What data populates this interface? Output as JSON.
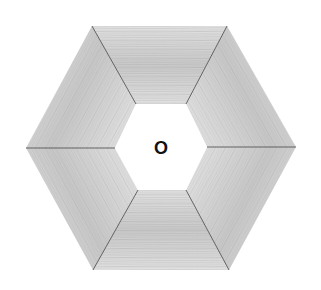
{
  "figure": {
    "center_label": "O",
    "colors": {
      "wood_base": "#c9c9c9",
      "wood_light": "#e2e2e2",
      "wood_dark": "#9a9a9a",
      "seam": "#555555",
      "hole": "#ffffff"
    },
    "outer_hexagon": [
      [
        92,
        26
      ],
      [
        227,
        26
      ],
      [
        296,
        147
      ],
      [
        229,
        270
      ],
      [
        93,
        270
      ],
      [
        26,
        148
      ]
    ],
    "inner_hexagon": [
      [
        136,
        104
      ],
      [
        186,
        104
      ],
      [
        207,
        147
      ],
      [
        186,
        190
      ],
      [
        138,
        190
      ],
      [
        115,
        148
      ]
    ],
    "pieces": [
      {
        "name": "top",
        "grain": "horizontal"
      },
      {
        "name": "upper-right",
        "grain": "diagonal"
      },
      {
        "name": "lower-right",
        "grain": "diagonal"
      },
      {
        "name": "bottom",
        "grain": "horizontal"
      },
      {
        "name": "lower-left",
        "grain": "diagonal"
      },
      {
        "name": "upper-left",
        "grain": "diagonal"
      }
    ],
    "label_position": [
      161,
      148
    ]
  }
}
